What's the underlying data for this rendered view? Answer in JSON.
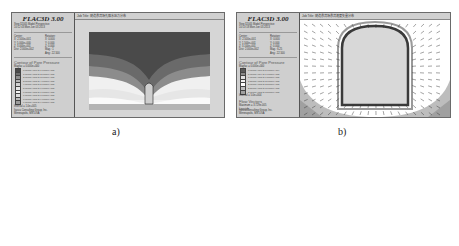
{
  "panels": [
    {
      "id": "a",
      "app_title": "FLAC3D 3.00",
      "step_line": "Step 32005  Model Perspective",
      "date_line": "10:12:43 Mon Jun 03 2013",
      "center_label": "Center:",
      "center": [
        "X: 2.500e+001",
        "Y: 5.000e+000",
        "Z: 3.000e+001"
      ],
      "dist": "Dist: 2.000e+002",
      "rotation_label": "Rotation:",
      "rotation": [
        "X:  0.000",
        "Y:  0.000",
        "Z:  0.000"
      ],
      "mag": "Mag.:    1",
      "ang": "Ang.:  22.500",
      "legend_title": "Contour of Pore Pressure",
      "legend_sub": "Magfac = 0.000e+000",
      "legend_entries": [
        {
          "color": "#4a4a4a",
          "label": "0.0000e+000 to 1.0000e+005"
        },
        {
          "color": "#6e6e6e",
          "label": "1.0000e+005 to 2.0000e+005"
        },
        {
          "color": "#8e8e8e",
          "label": "2.0000e+005 to 3.0000e+005"
        },
        {
          "color": "#b4b4b4",
          "label": "3.0000e+005 to 4.0000e+005"
        },
        {
          "color": "#d2d2d2",
          "label": "4.0000e+005 to 5.0000e+005"
        },
        {
          "color": "#e6e6e6",
          "label": "5.0000e+005 to 6.0000e+005"
        },
        {
          "color": "#f4f4f4",
          "label": "6.0000e+005 to 7.0000e+005"
        },
        {
          "color": "#dcdcdc",
          "label": "7.0000e+005 to 8.0000e+005"
        },
        {
          "color": "#bcbcbc",
          "label": "8.0000e+005 to 9.0000e+005"
        },
        {
          "color": "#9c9c9c",
          "label": "9.0000e+005 to 9.8000e+005"
        }
      ],
      "legend_interval": "Interval = 1.0e+005",
      "job_title": "Job Title: 隧道渗流场孔隙水压力分布",
      "footer": [
        "Itasca Consulting Group, Inc.",
        "Minneapolis, MN  USA"
      ],
      "caption": "a)"
    },
    {
      "id": "b",
      "app_title": "FLAC3D 3.00",
      "step_line": "Step 32005  Model Perspective",
      "date_line": "10:13:18 Mon Jun 03 2013",
      "center_label": "Center:",
      "center": [
        "X: 2.500e+001",
        "Y: 1.500e+001",
        "Z: 3.100e+001"
      ],
      "dist": "Dist: 2.000e+002",
      "rotation_label": "Rotation:",
      "rotation": [
        "X:  0.000",
        "Y:  0.000",
        "Z:  0.000"
      ],
      "mag": "Mag.:   6.25",
      "ang": "Ang.:  22.500",
      "legend_title": "Contour of Pore Pressure",
      "legend_sub": "Magfac = 0.000e+000",
      "legend_entries": [
        {
          "color": "#5a5a5a",
          "label": "0.0000e+000 to 5.0000e+004"
        },
        {
          "color": "#8a8a8a",
          "label": "5.0000e+004 to 1.0000e+005"
        },
        {
          "color": "#e0e0e0",
          "label": "1.0000e+005 to 1.5000e+005"
        },
        {
          "color": "#f2f2f2",
          "label": "1.5000e+005 to 2.0000e+005"
        },
        {
          "color": "#ffffff",
          "label": "2.0000e+005 to 2.5000e+005"
        },
        {
          "color": "#bdbdbd",
          "label": "2.5000e+005 to 3.0000e+005"
        },
        {
          "color": "#a0a0a0",
          "label": "3.0000e+005 to 3.5000e+005"
        }
      ],
      "legend_interval": "Interval = 5.0e+004",
      "flow_title": "Flow Vectors",
      "flow_max": "Maximum =  3.729e-005",
      "flow_linestyle": "Linestyle",
      "job_title": "Job Title: 隧道渗流场渗流速度矢量分布",
      "footer": [
        "Itasca Consulting Group, Inc.",
        "Minneapolis, MN  USA"
      ],
      "caption": "b)"
    }
  ]
}
